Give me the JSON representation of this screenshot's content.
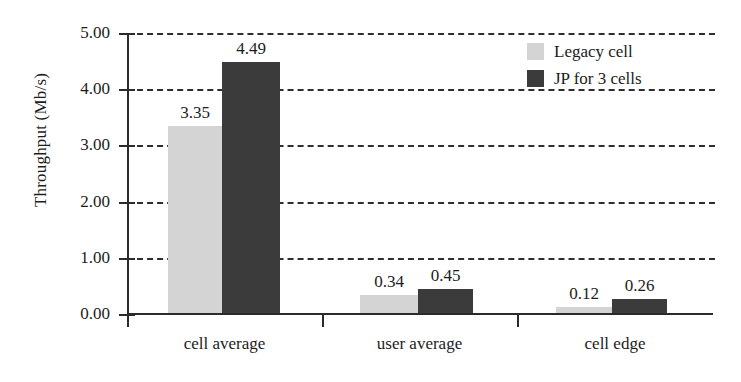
{
  "chart_data": {
    "type": "bar",
    "title": "",
    "xlabel": "",
    "ylabel": "Throughput (Mb/s)",
    "ylim": [
      0,
      5
    ],
    "ytick_labels": [
      "5.00",
      "4.00",
      "3.00",
      "2.00",
      "1.00",
      "0.00"
    ],
    "ytick_values": [
      5,
      4,
      3,
      2,
      1,
      0
    ],
    "grid": "horizontal-dashed",
    "legend_position": "top-right",
    "categories": [
      "cell average",
      "user average",
      "cell edge"
    ],
    "series": [
      {
        "name": "Legacy cell",
        "color": "#d4d4d4",
        "values": [
          3.35,
          0.34,
          0.12
        ],
        "labels": [
          "3.35",
          "0.34",
          "0.12"
        ]
      },
      {
        "name": "JP for 3 cells",
        "color": "#3b3b3b",
        "values": [
          4.49,
          0.45,
          0.26
        ],
        "labels": [
          "4.49",
          "0.45",
          "0.26"
        ]
      }
    ]
  },
  "legend": {
    "items": [
      {
        "label": "Legacy cell",
        "color": "#d4d4d4"
      },
      {
        "label": "JP for 3 cells",
        "color": "#3b3b3b"
      }
    ]
  }
}
